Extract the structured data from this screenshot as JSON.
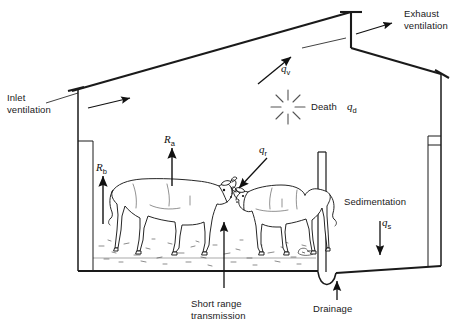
{
  "diagram": {
    "type": "cross-section schematic",
    "background_color": "#ffffff",
    "line_color": "#1a1a1a"
  },
  "labels": {
    "inlet_ventilation": "Inlet\nventilation",
    "exhaust_ventilation": "Exhaust\nventilation",
    "death": "Death",
    "sedimentation": "Sedimentation",
    "short_range_transmission": "Short range\ntransmission",
    "drainage": "Drainage"
  },
  "symbols": {
    "q_v": {
      "base": "q",
      "sub": "v",
      "meaning": "ventilation removal rate"
    },
    "q_d": {
      "base": "q",
      "sub": "d",
      "meaning": "death rate"
    },
    "q_r": {
      "base": "q",
      "sub": "r",
      "meaning": "short range / direct rate"
    },
    "q_s": {
      "base": "q",
      "sub": "s",
      "meaning": "sedimentation rate"
    },
    "R_a": {
      "base": "R",
      "sub": "a",
      "meaning": "airborne release rate"
    },
    "R_b": {
      "base": "R",
      "sub": "b",
      "meaning": "background release rate"
    }
  },
  "icons": {
    "death_burst": "burst-icon",
    "cow_left": "cow-icon",
    "cow_right": "cow-icon"
  }
}
